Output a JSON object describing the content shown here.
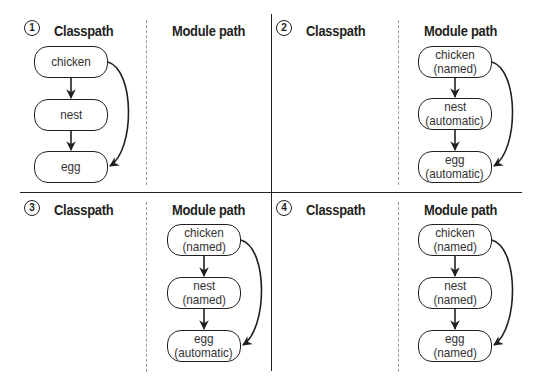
{
  "diagram": {
    "labels": {
      "classpath": "Classpath",
      "module_path": "Module path"
    },
    "colors": {
      "stroke": "#231f20",
      "divider_dashed": "#9a9a9a",
      "background": "#ffffff"
    },
    "panels": [
      {
        "number": "1",
        "classpath_nodes": [
          {
            "name": "chicken",
            "type": ""
          },
          {
            "name": "nest",
            "type": ""
          },
          {
            "name": "egg",
            "type": ""
          }
        ],
        "module_path_nodes": []
      },
      {
        "number": "2",
        "classpath_nodes": [],
        "module_path_nodes": [
          {
            "name": "chicken",
            "type": "(named)"
          },
          {
            "name": "nest",
            "type": "(automatic)"
          },
          {
            "name": "egg",
            "type": "(automatic)"
          }
        ]
      },
      {
        "number": "3",
        "classpath_nodes": [],
        "module_path_nodes": [
          {
            "name": "chicken",
            "type": "(named)"
          },
          {
            "name": "nest",
            "type": "(named)"
          },
          {
            "name": "egg",
            "type": "(automatic)"
          }
        ]
      },
      {
        "number": "4",
        "classpath_nodes": [],
        "module_path_nodes": [
          {
            "name": "chicken",
            "type": "(named)"
          },
          {
            "name": "nest",
            "type": "(named)"
          },
          {
            "name": "egg",
            "type": "(named)"
          }
        ]
      }
    ],
    "edges": [
      {
        "from": "chicken",
        "to": "nest"
      },
      {
        "from": "nest",
        "to": "egg"
      },
      {
        "from": "chicken",
        "to": "egg"
      }
    ]
  }
}
